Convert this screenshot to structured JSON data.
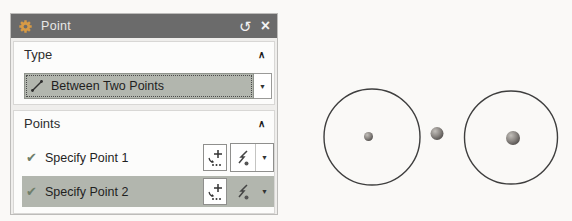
{
  "dialog": {
    "title": "Point",
    "titlebar": {
      "reset_glyph": "↺",
      "close_glyph": "×"
    },
    "type_section": {
      "label": "Type",
      "collapse_glyph": "∧",
      "dropdown_value": "Between Two Points",
      "dropdown_arrow_glyph": "▼"
    },
    "points_section": {
      "label": "Points",
      "collapse_glyph": "∧",
      "rows": [
        {
          "check_glyph": "✔",
          "label": "Specify Point 1",
          "selected": false,
          "arrow_glyph": "▼"
        },
        {
          "check_glyph": "✔",
          "label": "Specify Point 2",
          "selected": true,
          "arrow_glyph": "▼"
        }
      ]
    }
  },
  "colors": {
    "titlebar_bg": "#6b6b6b",
    "selection_bg": "#b2b6ae",
    "check_green": "#6e7e6a",
    "gear_orange": "#d79a45",
    "wireframe_stroke": "#3e3e3e"
  },
  "canvas": {
    "circles": [
      {
        "cx": 372,
        "cy": 137,
        "r": 48
      },
      {
        "cx": 511,
        "cy": 137.5,
        "r": 46.5
      }
    ],
    "spheres": [
      {
        "cx": 368.5,
        "cy": 136.5,
        "r": 4.5,
        "name": "point-1-center"
      },
      {
        "cx": 437,
        "cy": 133.5,
        "r": 6.5,
        "name": "midpoint-marker"
      },
      {
        "cx": 513,
        "cy": 138,
        "r": 7,
        "name": "point-2-center"
      }
    ]
  }
}
